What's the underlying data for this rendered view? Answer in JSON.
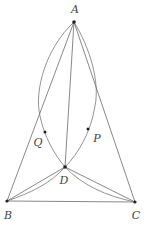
{
  "diagram": {
    "type": "geometry",
    "points": {
      "A": {
        "label": "A",
        "x": 74,
        "y": 22,
        "label_x": 75,
        "label_y": 9
      },
      "B": {
        "label": "B",
        "x": 7,
        "y": 201,
        "label_x": 8,
        "label_y": 215
      },
      "C": {
        "label": "C",
        "x": 135,
        "y": 202,
        "label_x": 136,
        "label_y": 215
      },
      "D": {
        "label": "D",
        "x": 65,
        "y": 167,
        "label_x": 64,
        "label_y": 180
      },
      "P": {
        "label": "P",
        "x": 88,
        "y": 129,
        "label_x": 97,
        "label_y": 138
      },
      "Q": {
        "label": "Q",
        "x": 45,
        "y": 132,
        "label_x": 38,
        "label_y": 142
      }
    },
    "segments": [
      "AB",
      "AC",
      "AD",
      "BC",
      "BD",
      "CD"
    ],
    "arcs": [
      {
        "name": "arc-AQD",
        "from": "A",
        "through": "Q",
        "to": "D"
      },
      {
        "name": "arc-APD",
        "from": "A",
        "through": "P",
        "to": "D"
      },
      {
        "name": "arc-BD",
        "from": "B",
        "to": "D"
      },
      {
        "name": "arc-DC",
        "from": "D",
        "to": "C"
      }
    ],
    "colors": {
      "line": "#6a6a6a",
      "point": "#222222",
      "label": "#444444"
    }
  }
}
